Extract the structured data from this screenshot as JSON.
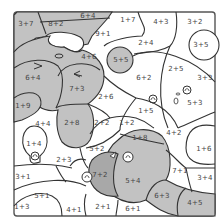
{
  "puzzle": {
    "type": "color-by-number",
    "colors": {
      "shaded": "#c2c2c2",
      "unshaded": "#ffffff",
      "outline": "#333333",
      "frame": "#555555"
    },
    "regions": [
      {
        "label": "3+7",
        "x": 26,
        "y": 24,
        "shaded": true
      },
      {
        "label": "8+2",
        "x": 56,
        "y": 24,
        "shaded": true
      },
      {
        "label": "6+4",
        "x": 88,
        "y": 16,
        "shaded": true
      },
      {
        "label": "1+7",
        "x": 128,
        "y": 20,
        "shaded": false
      },
      {
        "label": "4+3",
        "x": 161,
        "y": 22,
        "shaded": false
      },
      {
        "label": "3+2",
        "x": 195,
        "y": 22,
        "shaded": false
      },
      {
        "label": "9+1",
        "x": 103,
        "y": 34,
        "shaded": true
      },
      {
        "label": "2+4",
        "x": 146,
        "y": 43,
        "shaded": false
      },
      {
        "label": "3+5",
        "x": 201,
        "y": 45,
        "shaded": false
      },
      {
        "label": "5+5",
        "x": 121,
        "y": 60,
        "shaded": true
      },
      {
        "label": "4+6",
        "x": 89,
        "y": 57,
        "shaded": true
      },
      {
        "label": "6+4",
        "x": 33,
        "y": 78,
        "shaded": true
      },
      {
        "label": "6+2",
        "x": 144,
        "y": 78,
        "shaded": false
      },
      {
        "label": "2+5",
        "x": 176,
        "y": 69,
        "shaded": false
      },
      {
        "label": "3+3",
        "x": 205,
        "y": 78,
        "shaded": false
      },
      {
        "label": "7+3",
        "x": 77,
        "y": 89,
        "shaded": true
      },
      {
        "label": "1+9",
        "x": 23,
        "y": 106,
        "shaded": true
      },
      {
        "label": "2+6",
        "x": 106,
        "y": 97,
        "shaded": false
      },
      {
        "label": "1+5",
        "x": 146,
        "y": 111,
        "shaded": false
      },
      {
        "label": "5+3",
        "x": 195,
        "y": 103,
        "shaded": false
      },
      {
        "label": "4+4",
        "x": 43,
        "y": 124,
        "shaded": false
      },
      {
        "label": "2+8",
        "x": 72,
        "y": 123,
        "shaded": true
      },
      {
        "label": "2+2",
        "x": 102,
        "y": 123,
        "shaded": false
      },
      {
        "label": "1+2",
        "x": 127,
        "y": 123,
        "shaded": false
      },
      {
        "label": "1+8",
        "x": 140,
        "y": 138,
        "shaded": true
      },
      {
        "label": "4+2",
        "x": 174,
        "y": 133,
        "shaded": false
      },
      {
        "label": "1+4",
        "x": 34,
        "y": 144,
        "shaded": false
      },
      {
        "label": "1+6",
        "x": 204,
        "y": 149,
        "shaded": false
      },
      {
        "label": "2+3",
        "x": 64,
        "y": 160,
        "shaded": false
      },
      {
        "label": "5+2",
        "x": 97,
        "y": 149,
        "shaded": false
      },
      {
        "label": "7+1",
        "x": 180,
        "y": 171,
        "shaded": false
      },
      {
        "label": "3+1",
        "x": 23,
        "y": 177,
        "shaded": false
      },
      {
        "label": "7+2",
        "x": 100,
        "y": 175,
        "shaded": true
      },
      {
        "label": "5+4",
        "x": 133,
        "y": 181,
        "shaded": true
      },
      {
        "label": "3+4",
        "x": 205,
        "y": 178,
        "shaded": false
      },
      {
        "label": "6+3",
        "x": 162,
        "y": 196,
        "shaded": true
      },
      {
        "label": "5+1",
        "x": 42,
        "y": 196,
        "shaded": false
      },
      {
        "label": "4+5",
        "x": 195,
        "y": 203,
        "shaded": true
      },
      {
        "label": "1+3",
        "x": 22,
        "y": 207,
        "shaded": false
      },
      {
        "label": "4+1",
        "x": 74,
        "y": 210,
        "shaded": false
      },
      {
        "label": "2+1",
        "x": 103,
        "y": 207,
        "shaded": false
      },
      {
        "label": "6+1",
        "x": 133,
        "y": 209,
        "shaded": false
      }
    ]
  }
}
